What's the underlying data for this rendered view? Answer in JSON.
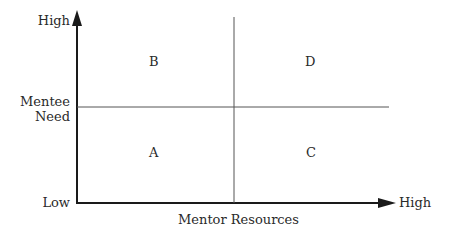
{
  "diagram": {
    "type": "2x2 quadrant matrix",
    "y_axis": {
      "title_line1": "Mentee",
      "title_line2": "Need",
      "high_label": "High",
      "low_label": "Low"
    },
    "x_axis": {
      "title": "Mentor Resources",
      "high_label": "High"
    },
    "quadrants": [
      {
        "id": "B",
        "label": "B",
        "position": "top-left"
      },
      {
        "id": "D",
        "label": "D",
        "position": "top-right"
      },
      {
        "id": "A",
        "label": "A",
        "position": "bottom-left"
      },
      {
        "id": "C",
        "label": "C",
        "position": "bottom-right"
      }
    ],
    "colors": {
      "axis": "#1a1a1a",
      "divider": "#555555",
      "text": "#2a2a2a"
    }
  }
}
